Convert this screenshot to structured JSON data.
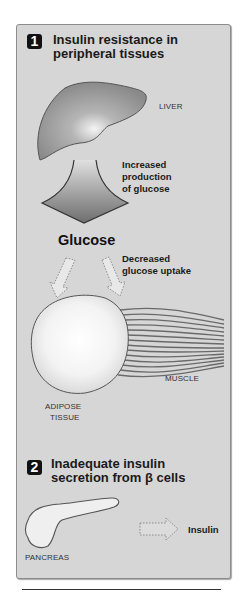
{
  "section1": {
    "number": "1",
    "title_line1": "Insulin resistance in",
    "title_line2": "peripheral tissues"
  },
  "labels": {
    "liver": "LIVER",
    "increased_line1": "Increased",
    "increased_line2": "production",
    "increased_line3": "of glucose",
    "glucose": "Glucose",
    "decreased_line1": "Decreased",
    "decreased_line2": "glucose uptake",
    "muscle": "MUSCLE",
    "adipose_line1": "ADIPOSE",
    "adipose_line2": "TISSUE",
    "pancreas": "PANCREAS",
    "insulin": "Insulin"
  },
  "section2": {
    "number": "2",
    "title_line1": "Inadequate insulin",
    "title_line2": "secretion from β cells"
  },
  "colors": {
    "panel_bg": "#d6d6d6",
    "badge_bg": "#111111",
    "organ_gray": "#8e8e8e"
  }
}
